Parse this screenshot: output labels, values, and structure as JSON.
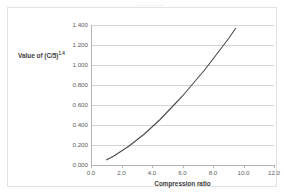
{
  "clipped_header": {
    "text": "···········"
  },
  "chart_data": {
    "type": "line",
    "title": "",
    "xlabel": "Compression ratio",
    "ylabel": "Value of (C/5)",
    "ylabel_exponent": "1.4",
    "xlim": [
      0.0,
      12.0
    ],
    "ylim": [
      0.0,
      1.4
    ],
    "grid": true,
    "legend": "none",
    "x_ticks": [
      "0.0",
      "2.0",
      "4.0",
      "6.0",
      "8.0",
      "10.0",
      "12.0"
    ],
    "x_tick_values": [
      0.0,
      2.0,
      4.0,
      6.0,
      8.0,
      10.0,
      12.0
    ],
    "y_ticks": [
      "0.000",
      "0.200",
      "0.400",
      "0.600",
      "0.800",
      "1.000",
      "1.200",
      "1.400"
    ],
    "y_tick_values": [
      0.0,
      0.2,
      0.4,
      0.6,
      0.8,
      1.0,
      1.2,
      1.4
    ],
    "series": [
      {
        "name": "(C/5)^1.4",
        "color": "#4a4a4a",
        "x": [
          1.0,
          1.5,
          2.0,
          2.5,
          3.0,
          3.5,
          4.0,
          4.5,
          5.0,
          5.5,
          6.0,
          6.5,
          7.0,
          7.5,
          8.0,
          8.5,
          9.0,
          9.5,
          10.0
        ],
        "values": [
          0.05,
          0.09,
          0.14,
          0.19,
          0.25,
          0.31,
          0.38,
          0.45,
          0.53,
          0.61,
          0.69,
          0.78,
          0.87,
          0.96,
          1.06,
          1.16,
          1.26,
          1.37,
          1.48
        ]
      }
    ]
  }
}
